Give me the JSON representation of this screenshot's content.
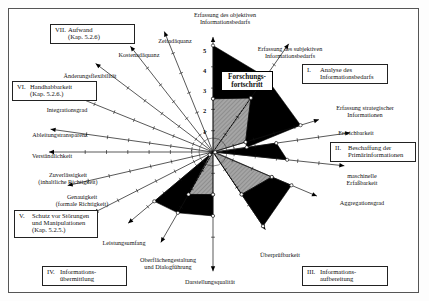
{
  "chart_data": {
    "type": "radar",
    "center_label": "Forschungsfortschritt",
    "scale": {
      "min": 0,
      "max": 5,
      "ticks": [
        1,
        2,
        3,
        4,
        5
      ]
    },
    "axes": [
      {
        "id": "obj",
        "label": "Erfassung des objektiven Informationsbedarfs",
        "angle": 0
      },
      {
        "id": "subj",
        "label": "Erfassung des subjektiven Informationsbedarfs",
        "angle": 35
      },
      {
        "id": "strat",
        "label": "Erfassung strategischer Informationen",
        "angle": 73
      },
      {
        "id": "erreich",
        "label": "Erreichbarkeit",
        "angle": 82
      },
      {
        "id": "masch",
        "label": "maschinelle Erfaßbarkeit",
        "angle": 96
      },
      {
        "id": "aggr",
        "label": "Aggregationsgrad",
        "angle": 113
      },
      {
        "id": "ueber",
        "label": "Überprüfbarkeit",
        "angle": 146
      },
      {
        "id": "darst",
        "label": "Darstellungsqualität",
        "angle": 180
      },
      {
        "id": "oberfl",
        "label": "Oberflächengestaltung und Dialogführung",
        "angle": 210
      },
      {
        "id": "leist",
        "label": "Leistungsumfang",
        "angle": 230
      },
      {
        "id": "genau",
        "label": "Genauigkeit (formale Richtigkeit)",
        "angle": 243
      },
      {
        "id": "zuverl",
        "label": "Zuverlässigkeit (inhaltliche Richtigkeit)",
        "angle": 257
      },
      {
        "id": "verst",
        "label": "Verständlichkeit",
        "angle": 270
      },
      {
        "id": "ableit",
        "label": "Ableitungstransparenz",
        "angle": 278
      },
      {
        "id": "integr",
        "label": "Integrationsgrad",
        "angle": 292
      },
      {
        "id": "aender",
        "label": "Änderungsflexibilität",
        "angle": 307
      },
      {
        "id": "kosten",
        "label": "Kostenadäquanz",
        "angle": 322
      },
      {
        "id": "zeit",
        "label": "Zeitadäquanz",
        "angle": 338
      }
    ],
    "series": [
      {
        "name": "Stand der Forschung",
        "fill": "#9a9a9a",
        "pattern": "hatched",
        "regions": [
          {
            "group": "I",
            "points": [
              [
                "obj",
                2.5
              ],
              [
                "subj",
                3.1
              ],
              [
                "strat",
                1.6
              ]
            ]
          },
          {
            "group": "II-III",
            "points": [
              [
                "masch",
                0.1
              ],
              [
                "aggr",
                3.0
              ],
              [
                "ueber",
                2.4
              ]
            ]
          },
          {
            "group": "IV",
            "points": [
              [
                "darst",
                2.0
              ],
              [
                "oberfl",
                2.3
              ],
              [
                "leist",
                0.2
              ]
            ]
          }
        ]
      },
      {
        "name": "Forschungsfortschritt",
        "fill": "#000000",
        "pattern": "solid",
        "regions": [
          {
            "group": "I",
            "points": [
              [
                "obj",
                5.0
              ],
              [
                "subj",
                4.3
              ],
              [
                "strat",
                4.3
              ],
              [
                "erreich",
                1.6
              ],
              [
                "strat",
                1.6
              ],
              [
                "subj",
                3.1
              ],
              [
                "obj",
                2.5
              ]
            ]
          },
          {
            "group": "II",
            "points": [
              [
                "erreich",
                3.0
              ],
              [
                "masch",
                3.5
              ],
              [
                "masch",
                0.1
              ]
            ]
          },
          {
            "group": "III",
            "points": [
              [
                "aggr",
                3.0
              ],
              [
                "aggr",
                4.0
              ],
              [
                "ueber",
                4.2
              ],
              [
                "ueber",
                2.4
              ]
            ]
          },
          {
            "group": "IV",
            "points": [
              [
                "darst",
                2.0
              ],
              [
                "darst",
                3.0
              ],
              [
                "oberfl",
                3.3
              ],
              [
                "leist",
                3.6
              ],
              [
                "leist",
                0.2
              ],
              [
                "oberfl",
                2.3
              ]
            ]
          }
        ]
      }
    ],
    "groups": [
      {
        "num": "I.",
        "label": "Analyse des Informationsbedarfs"
      },
      {
        "num": "II.",
        "label": "Beschaffung der Primärinformationen"
      },
      {
        "num": "III.",
        "label": "Informations-aufbereitung"
      },
      {
        "num": "IV.",
        "label": "Informations-übermittlung"
      },
      {
        "num": "V.",
        "label": "Schutz vor Störungen und Manipulationen (Kap. 5.2.5.)"
      },
      {
        "num": "VI.",
        "label": "Handhabbarkeit (Kap. 5.2.6.)"
      },
      {
        "num": "VII.",
        "label": "Aufwand (Kap. 5.2.6)"
      }
    ]
  },
  "labels": {
    "center": [
      "Forschungs-",
      "fortschritt"
    ],
    "ticks": [
      "1",
      "2",
      "3",
      "4",
      "5"
    ],
    "axes": {
      "obj": [
        "Erfassung des objektiven",
        "Informationsbedarfs"
      ],
      "subj": [
        "Erfassung des subjektiven",
        "Informationsbedarfs"
      ],
      "strat": [
        "Erfassung strategischer",
        "Informationen"
      ],
      "erreich": [
        "Erreichbarkeit"
      ],
      "masch": [
        "maschinelle",
        "Erfaßbarkeit"
      ],
      "aggr": [
        "Aggregationsgrad"
      ],
      "ueber": [
        "Überprüfbarkeit"
      ],
      "darst": [
        "Darstellungsqualität"
      ],
      "oberfl": [
        "Oberflächengestaltung",
        "und Dialogführung"
      ],
      "leist": [
        "Leistungsumfang"
      ],
      "genau": [
        "Genauigkeit",
        "(formale Richtigkeit)"
      ],
      "zuverl": [
        "Zuverlässigkeit",
        "(inhaltliche Richtigkeit)"
      ],
      "verst": [
        "Verständlichkeit"
      ],
      "ableit": [
        "Ableitungstransparenz"
      ],
      "integr": [
        "Integrationsgrad"
      ],
      "aender": [
        "Änderungsflexibilität"
      ],
      "kosten": [
        "Kostenadäquanz"
      ],
      "zeit": [
        "Zeitadäquanz"
      ]
    },
    "groups": {
      "g1": {
        "num": "I.",
        "lines": [
          "Analyse des",
          "Informationsbedarfs"
        ]
      },
      "g2": {
        "num": "II.",
        "lines": [
          "Beschaffung der",
          "Primärinformationen"
        ]
      },
      "g3": {
        "num": "III.",
        "lines": [
          "Informations-",
          "aufbereitung"
        ]
      },
      "g4": {
        "num": "IV.",
        "lines": [
          "Informations-",
          "übermittlung"
        ]
      },
      "g5": {
        "num": "V.",
        "lines": [
          "Schutz vor Störungen",
          "und Manipulationen",
          "(Kap. 5.2.5.)"
        ]
      },
      "g6": {
        "num": "VI.",
        "lines": [
          "Handhabbarkeit",
          "(Kap. 5.2.6.)"
        ]
      },
      "g7": {
        "num": "VII.",
        "lines": [
          "Aufwand",
          "(Kap. 5.2.6)"
        ]
      }
    }
  }
}
